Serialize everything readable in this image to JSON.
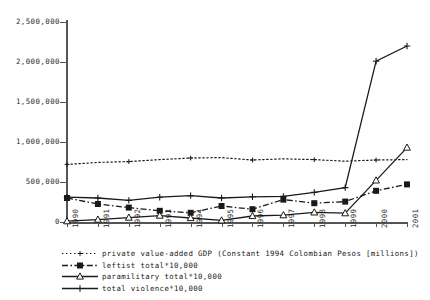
{
  "chart_data": {
    "type": "line",
    "title": "",
    "xlabel": "",
    "ylabel": "",
    "x": [
      1990,
      1991,
      1992,
      1993,
      1994,
      1995,
      1996,
      1997,
      1998,
      1999,
      2000,
      2001
    ],
    "categories": [
      "1990",
      "1991",
      "1992",
      "1993",
      "1994",
      "1995",
      "1996",
      "1997",
      "1998",
      "1999",
      "2000",
      "2001"
    ],
    "ylim": [
      0,
      2500000
    ],
    "xlim": [
      1990,
      2001
    ],
    "grid": false,
    "legend_position": "below",
    "yticks": [
      0,
      500000,
      1000000,
      1500000,
      2000000,
      2500000
    ],
    "ytick_labels": [
      "0",
      "500,000",
      "1,000,000",
      "1,500,000",
      "2,000,000",
      "2,500,000"
    ],
    "series": [
      {
        "name": "private value-added GDP (Constant 1994 Colombian Pesos [millions])",
        "marker": "dot-plus",
        "linestyle": "dotted",
        "color": "#1a1a1a",
        "values": [
          720000,
          745000,
          755000,
          780000,
          800000,
          805000,
          775000,
          790000,
          780000,
          760000,
          775000,
          780000
        ]
      },
      {
        "name": "leftist total*10,000",
        "marker": "filled-square",
        "linestyle": "dash-dot",
        "color": "#1a1a1a",
        "values": [
          300000,
          225000,
          180000,
          140000,
          115000,
          200000,
          160000,
          280000,
          235000,
          255000,
          390000,
          470000
        ]
      },
      {
        "name": "paramilitary total*10,000",
        "marker": "open-triangle",
        "linestyle": "solid",
        "color": "#1a1a1a",
        "values": [
          10000,
          30000,
          55000,
          80000,
          50000,
          20000,
          75000,
          85000,
          120000,
          110000,
          520000,
          930000
        ]
      },
      {
        "name": "total violence*10,000",
        "marker": "plus",
        "linestyle": "solid",
        "color": "#1a1a1a",
        "values": [
          310000,
          300000,
          270000,
          310000,
          330000,
          300000,
          315000,
          320000,
          370000,
          430000,
          2010000,
          2200000
        ]
      }
    ]
  },
  "legend": {
    "items": [
      {
        "label": "private value-added GDP (Constant 1994 Colombian Pesos [millions])",
        "key": "dotted-plus-key"
      },
      {
        "label": "leftist total*10,000",
        "key": "dashdot-square-key"
      },
      {
        "label": "paramilitary total*10,000",
        "key": "solid-triangle-key"
      },
      {
        "label": "total violence*10,000",
        "key": "solid-plus-key"
      }
    ]
  }
}
